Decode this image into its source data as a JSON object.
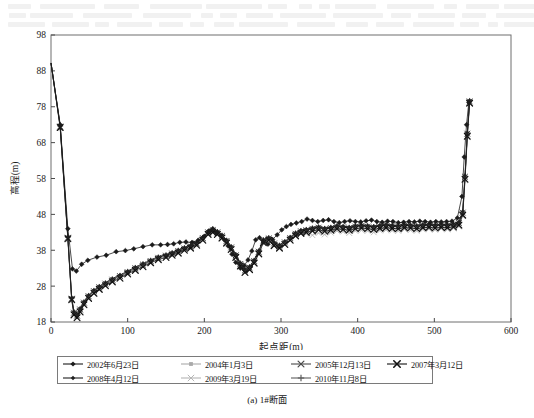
{
  "figure": {
    "caption": "(a) 1#断面"
  },
  "chart_data": {
    "type": "line",
    "title": "",
    "xlabel": "起点距(m)",
    "ylabel": "高程(m)",
    "xlim": [
      0,
      600
    ],
    "ylim": [
      18,
      98
    ],
    "xticks": [
      0,
      100,
      200,
      300,
      400,
      500,
      600
    ],
    "yticks": [
      18,
      28,
      38,
      48,
      58,
      68,
      78,
      88,
      98
    ],
    "grid": false,
    "legend_position": "below-axes",
    "series": [
      {
        "name": "2002年6月23日",
        "color": "#1b1b1b",
        "marker": "diamond",
        "x": [
          0,
          12,
          22,
          28,
          33,
          40,
          48,
          60,
          72,
          85,
          97,
          108,
          120,
          132,
          143,
          152,
          160,
          168,
          176,
          184,
          192,
          200,
          206,
          211,
          216,
          221,
          226,
          231,
          236,
          241,
          247,
          252,
          257,
          262,
          267,
          272,
          277,
          283,
          289,
          295,
          301,
          307,
          313,
          320,
          327,
          334,
          341,
          348,
          355,
          362,
          369,
          376,
          383,
          390,
          397,
          404,
          411,
          418,
          425,
          432,
          439,
          446,
          453,
          460,
          467,
          474,
          481,
          488,
          495,
          502,
          509,
          516,
          523,
          530,
          536,
          539,
          542,
          545
        ],
        "y": [
          90.2,
          73.0,
          44.0,
          32.8,
          32.2,
          34.1,
          35.2,
          36.1,
          36.6,
          37.6,
          37.9,
          38.4,
          39.0,
          39.5,
          39.5,
          39.6,
          39.8,
          40.2,
          40.3,
          40.2,
          40.8,
          41.9,
          43.4,
          44.0,
          43.0,
          42.1,
          40.9,
          39.2,
          36.9,
          34.6,
          33.0,
          33.7,
          35.3,
          37.8,
          40.9,
          41.5,
          40.3,
          39.7,
          41.0,
          42.3,
          43.7,
          44.6,
          45.2,
          45.6,
          46.0,
          46.7,
          46.3,
          46.0,
          46.3,
          46.5,
          46.0,
          45.7,
          46.0,
          46.2,
          46.0,
          45.9,
          46.2,
          46.4,
          46.0,
          45.8,
          46.1,
          46.0,
          45.7,
          45.8,
          46.0,
          45.9,
          46.1,
          46.0,
          45.8,
          46.0,
          45.9,
          46.0,
          46.1,
          47.0,
          53.0,
          64.0,
          73.0,
          79.2
        ]
      },
      {
        "name": "2004年1月3日",
        "color": "#a9a9a9",
        "marker": "square",
        "x": [
          0,
          12,
          22,
          27,
          30,
          34,
          38,
          43,
          49,
          56,
          63,
          71,
          80,
          90,
          100,
          110,
          120,
          130,
          140,
          150,
          158,
          166,
          174,
          182,
          190,
          198,
          205,
          211,
          217,
          223,
          229,
          235,
          241,
          247,
          253,
          259,
          265,
          271,
          277,
          284,
          291,
          298,
          305,
          312,
          319,
          326,
          333,
          341,
          349,
          357,
          365,
          373,
          381,
          389,
          397,
          405,
          413,
          421,
          429,
          437,
          445,
          453,
          461,
          469,
          477,
          485,
          493,
          501,
          509,
          517,
          525,
          532,
          537,
          540,
          543,
          546
        ],
        "y": [
          90.2,
          72.0,
          41.0,
          24.0,
          20.2,
          19.4,
          21.0,
          23.0,
          24.8,
          26.2,
          27.3,
          28.3,
          29.4,
          30.5,
          31.6,
          32.6,
          33.6,
          34.7,
          35.6,
          36.2,
          36.8,
          37.4,
          38.2,
          38.8,
          39.6,
          41.0,
          42.6,
          43.2,
          42.6,
          41.6,
          40.2,
          38.4,
          36.2,
          33.8,
          32.0,
          32.8,
          34.6,
          37.2,
          40.3,
          41.0,
          39.5,
          38.8,
          39.8,
          41.0,
          42.2,
          42.9,
          43.2,
          43.6,
          43.9,
          43.5,
          43.8,
          44.2,
          44.0,
          43.8,
          44.2,
          44.4,
          44.2,
          44.0,
          44.3,
          44.5,
          44.3,
          44.2,
          44.5,
          44.4,
          44.2,
          44.5,
          44.6,
          44.4,
          44.6,
          44.5,
          44.7,
          45.2,
          48.0,
          58.0,
          70.0,
          79.5
        ]
      },
      {
        "name": "2005年12月13日",
        "color": "#4a4a4a",
        "marker": "cross",
        "x": [
          0,
          12,
          22,
          27,
          30,
          34,
          38,
          43,
          49,
          56,
          63,
          71,
          80,
          90,
          100,
          110,
          120,
          130,
          140,
          150,
          158,
          166,
          174,
          182,
          190,
          198,
          205,
          211,
          217,
          223,
          229,
          235,
          241,
          247,
          253,
          259,
          265,
          271,
          277,
          284,
          291,
          298,
          305,
          312,
          319,
          326,
          333,
          341,
          349,
          357,
          365,
          373,
          381,
          389,
          397,
          405,
          413,
          421,
          429,
          437,
          445,
          453,
          461,
          469,
          477,
          485,
          493,
          501,
          509,
          517,
          525,
          532,
          537,
          540,
          543,
          546
        ],
        "y": [
          90.2,
          72.5,
          41.5,
          24.5,
          20.6,
          19.8,
          21.5,
          23.4,
          25.2,
          26.6,
          27.7,
          28.7,
          29.8,
          30.8,
          31.9,
          33.0,
          34.0,
          35.0,
          35.9,
          36.5,
          37.1,
          37.8,
          38.5,
          39.1,
          39.9,
          41.4,
          43.0,
          43.6,
          43.0,
          42.0,
          40.6,
          38.8,
          36.6,
          34.2,
          32.4,
          33.2,
          35.0,
          37.6,
          40.7,
          41.3,
          39.9,
          39.2,
          40.2,
          41.4,
          42.6,
          43.3,
          43.6,
          44.0,
          44.3,
          43.9,
          44.2,
          44.6,
          44.4,
          44.2,
          44.6,
          44.8,
          44.6,
          44.4,
          44.7,
          44.9,
          44.7,
          44.6,
          44.9,
          44.8,
          44.6,
          44.9,
          45.0,
          44.8,
          45.0,
          44.9,
          45.1,
          45.6,
          48.5,
          58.5,
          70.5,
          79.5
        ]
      },
      {
        "name": "2007年3月12日",
        "color": "#111111",
        "marker": "cross-bold",
        "x": [
          0,
          12,
          22,
          27,
          30,
          34,
          38,
          43,
          49,
          56,
          63,
          71,
          80,
          90,
          100,
          110,
          120,
          130,
          140,
          150,
          158,
          166,
          174,
          182,
          190,
          198,
          205,
          211,
          217,
          223,
          229,
          235,
          241,
          247,
          253,
          259,
          265,
          271,
          277,
          284,
          291,
          298,
          305,
          312,
          319,
          326,
          333,
          341,
          349,
          357,
          365,
          373,
          381,
          389,
          397,
          405,
          413,
          421,
          429,
          437,
          445,
          453,
          461,
          469,
          477,
          485,
          493,
          501,
          509,
          517,
          525,
          532,
          537,
          540,
          543,
          546
        ],
        "y": [
          90.2,
          72.2,
          41.2,
          24.2,
          20.0,
          19.2,
          20.8,
          22.8,
          24.6,
          26.0,
          27.1,
          28.1,
          29.2,
          30.2,
          31.4,
          32.4,
          33.4,
          34.5,
          35.4,
          36.0,
          36.6,
          37.2,
          38.0,
          38.6,
          39.4,
          40.8,
          42.4,
          43.0,
          42.4,
          41.4,
          40.0,
          38.2,
          36.0,
          33.6,
          31.8,
          32.6,
          34.4,
          37.0,
          40.1,
          40.8,
          39.3,
          38.6,
          39.6,
          40.8,
          42.0,
          42.7,
          43.0,
          43.4,
          43.7,
          43.3,
          43.6,
          44.0,
          43.8,
          43.6,
          44.0,
          44.2,
          44.0,
          43.8,
          44.1,
          44.3,
          44.1,
          44.0,
          44.3,
          44.2,
          44.0,
          44.3,
          44.4,
          44.2,
          44.4,
          44.3,
          44.5,
          45.0,
          47.8,
          57.8,
          69.8,
          79.0
        ]
      },
      {
        "name": "2008年4月12日",
        "color": "#202020",
        "marker": "diamond-small",
        "x": [
          0,
          12,
          22,
          27,
          30,
          34,
          38,
          43,
          49,
          56,
          63,
          71,
          80,
          90,
          100,
          110,
          120,
          130,
          140,
          150,
          158,
          166,
          174,
          182,
          190,
          198,
          205,
          211,
          217,
          223,
          229,
          235,
          241,
          247,
          253,
          259,
          265,
          271,
          277,
          284,
          291,
          298,
          305,
          312,
          319,
          326,
          333,
          341,
          349,
          357,
          365,
          373,
          381,
          389,
          397,
          405,
          413,
          421,
          429,
          437,
          445,
          453,
          461,
          469,
          477,
          485,
          493,
          501,
          509,
          517,
          525,
          532,
          537,
          540,
          543,
          546
        ],
        "y": [
          90.2,
          72.8,
          41.8,
          24.8,
          20.9,
          20.1,
          21.8,
          23.7,
          25.5,
          26.9,
          28.0,
          29.0,
          30.1,
          31.1,
          32.2,
          33.3,
          34.3,
          35.3,
          36.2,
          36.8,
          37.4,
          38.1,
          38.8,
          39.4,
          40.2,
          41.7,
          43.3,
          43.9,
          43.3,
          42.3,
          40.9,
          39.1,
          36.9,
          34.5,
          32.7,
          33.5,
          35.3,
          37.9,
          41.0,
          41.6,
          40.2,
          39.5,
          40.5,
          41.7,
          42.9,
          43.6,
          43.9,
          44.3,
          44.6,
          44.2,
          44.5,
          44.9,
          44.7,
          44.5,
          44.9,
          45.1,
          44.9,
          44.7,
          45.0,
          45.2,
          45.0,
          44.9,
          45.2,
          45.1,
          44.9,
          45.2,
          45.3,
          45.1,
          45.3,
          45.2,
          45.4,
          45.9,
          48.8,
          58.8,
          70.8,
          79.8
        ]
      },
      {
        "name": "2009年3月19日",
        "color": "#b5b5b5",
        "marker": "cross-light",
        "x": [
          0,
          12,
          22,
          27,
          30,
          34,
          38,
          43,
          49,
          56,
          63,
          71,
          80,
          90,
          100,
          110,
          120,
          130,
          140,
          150,
          158,
          166,
          174,
          182,
          190,
          198,
          205,
          211,
          217,
          223,
          229,
          235,
          241,
          247,
          253,
          259,
          265,
          271,
          277,
          284,
          291,
          298,
          305,
          312,
          319,
          326,
          333,
          341,
          349,
          357,
          365,
          373,
          381,
          389,
          397,
          405,
          413,
          421,
          429,
          437,
          445,
          453,
          461,
          469,
          477,
          485,
          493,
          501,
          509,
          517,
          525,
          532,
          537,
          540,
          543,
          546
        ],
        "y": [
          90.2,
          72.3,
          41.3,
          24.3,
          20.4,
          19.6,
          21.2,
          23.1,
          24.9,
          26.3,
          27.4,
          28.4,
          29.5,
          30.6,
          31.7,
          32.8,
          33.8,
          34.8,
          35.7,
          36.3,
          36.9,
          37.5,
          38.3,
          38.9,
          39.7,
          41.1,
          42.7,
          43.3,
          42.7,
          41.7,
          40.3,
          38.5,
          36.3,
          33.9,
          32.1,
          32.9,
          34.7,
          37.3,
          40.4,
          41.1,
          39.6,
          38.9,
          39.9,
          41.1,
          42.3,
          43.0,
          42.6,
          42.2,
          42.8,
          42.4,
          42.9,
          43.4,
          43.2,
          42.8,
          43.4,
          43.6,
          43.4,
          43.0,
          43.5,
          43.7,
          43.5,
          43.4,
          43.8,
          43.6,
          43.4,
          43.8,
          43.9,
          43.7,
          44.0,
          43.8,
          44.1,
          44.6,
          47.5,
          57.5,
          69.5,
          79.2
        ]
      },
      {
        "name": "2010年11月8日",
        "color": "#5e5e5e",
        "marker": "plus",
        "x": [
          0,
          12,
          22,
          27,
          30,
          34,
          38,
          43,
          49,
          56,
          63,
          71,
          80,
          90,
          100,
          110,
          120,
          130,
          140,
          150,
          158,
          166,
          174,
          182,
          190,
          198,
          205,
          211,
          217,
          223,
          229,
          235,
          241,
          247,
          253,
          259,
          265,
          271,
          277,
          284,
          291,
          298,
          305,
          312,
          319,
          326,
          333,
          341,
          349,
          357,
          365,
          373,
          381,
          389,
          397,
          405,
          413,
          421,
          429,
          437,
          445,
          453,
          461,
          469,
          477,
          485,
          493,
          501,
          509,
          517,
          525,
          532,
          537,
          540,
          543,
          546
        ],
        "y": [
          90.2,
          72.6,
          41.6,
          24.6,
          20.7,
          19.9,
          21.6,
          23.5,
          25.3,
          26.7,
          27.8,
          28.8,
          29.9,
          30.9,
          32.0,
          33.1,
          34.1,
          35.1,
          36.0,
          36.6,
          37.2,
          37.9,
          38.6,
          39.2,
          40.0,
          41.5,
          43.1,
          43.7,
          43.1,
          42.1,
          40.7,
          38.9,
          36.7,
          34.3,
          32.5,
          33.3,
          35.1,
          37.7,
          40.8,
          41.4,
          40.0,
          39.3,
          40.3,
          41.5,
          42.7,
          43.4,
          43.7,
          44.1,
          44.4,
          44.0,
          44.3,
          44.7,
          44.5,
          44.3,
          44.7,
          44.9,
          44.7,
          44.5,
          44.8,
          45.0,
          44.8,
          44.7,
          45.0,
          44.9,
          44.7,
          45.0,
          45.1,
          44.9,
          45.1,
          45.0,
          45.2,
          45.7,
          48.6,
          58.6,
          70.6,
          79.6
        ]
      }
    ]
  },
  "legend": {
    "rows": [
      [
        {
          "label": "2002年6月23日",
          "marker": "diamond",
          "color": "#1b1b1b"
        },
        {
          "label": "2004年1月3日",
          "marker": "square",
          "color": "#a9a9a9"
        },
        {
          "label": "2005年12月13日",
          "marker": "cross",
          "color": "#4a4a4a"
        },
        {
          "label": "2007年3月12日",
          "marker": "cross-bold",
          "color": "#111111"
        }
      ],
      [
        {
          "label": "2008年4月12日",
          "marker": "diamond-small",
          "color": "#202020"
        },
        {
          "label": "2009年3月19日",
          "marker": "cross-light",
          "color": "#b5b5b5"
        },
        {
          "label": "2010年11月8日",
          "marker": "plus",
          "color": "#5e5e5e"
        }
      ]
    ]
  }
}
